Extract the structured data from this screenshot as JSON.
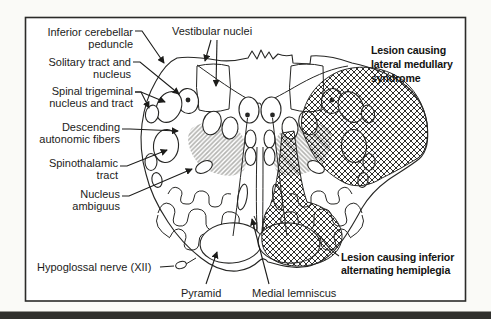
{
  "page": {
    "background": "#fafaf7",
    "rule_color": "#30302d"
  },
  "figure": {
    "ink": "#262624",
    "frame_color": "#2b2b29",
    "stipple_color": "#b3b3b0",
    "hatch_color": "#2e2e2c",
    "labels": {
      "inferior_cerebellar_peduncle": [
        "Inferior cerebellar",
        "peduncle"
      ],
      "solitary_tract": [
        "Solitary tract and",
        "nucleus"
      ],
      "spinal_trigeminal": [
        "Spinal trigeminal",
        "nucleus and tract"
      ],
      "descending_autonomic": [
        "Descending",
        "autonomic fibers"
      ],
      "spinothalamic": [
        "Spinothalamic",
        "tract"
      ],
      "nucleus_ambiguus": [
        "Nucleus",
        "ambiguus"
      ],
      "hypoglossal_nerve": "Hypoglossal nerve (XII)",
      "pyramid": "Pyramid",
      "medial_lemniscus": "Medial lemniscus",
      "vestibular_nuclei": "Vestibular nuclei"
    },
    "lesion_captions": {
      "lateral_medullary": [
        "Lesion causing",
        "lateral medullary",
        "syndrome"
      ],
      "inferior_alternating": [
        "Lesion causing inferior",
        "alternating hemiplegia"
      ]
    }
  }
}
